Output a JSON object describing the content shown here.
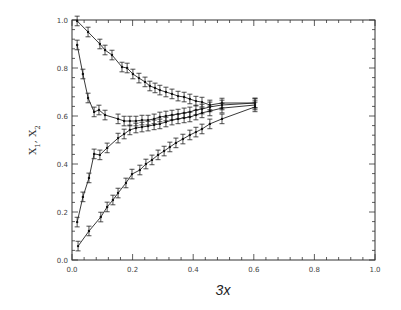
{
  "chart_data": {
    "type": "line",
    "title": "",
    "xlabel": "3x",
    "ylabel": "X1, X2",
    "xlim": [
      0.0,
      1.0
    ],
    "ylim": [
      0.0,
      1.0
    ],
    "grid": false,
    "legend": null,
    "x_ticks": [
      "0.0",
      "0.2",
      "0.4",
      "0.6",
      "0.8",
      "1.0"
    ],
    "y_ticks": [
      "0.0",
      "0.2",
      "0.4",
      "0.6",
      "0.8",
      "1.0"
    ],
    "error_bars": true,
    "series": [
      {
        "name": "upper (from 1.0)",
        "x": [
          0.017,
          0.053,
          0.092,
          0.109,
          0.132,
          0.165,
          0.182,
          0.201,
          0.221,
          0.241,
          0.257,
          0.274,
          0.29,
          0.31,
          0.33,
          0.35,
          0.37,
          0.389,
          0.409,
          0.429,
          0.455,
          0.495,
          0.604
        ],
        "y": [
          0.996,
          0.95,
          0.9,
          0.875,
          0.854,
          0.804,
          0.8,
          0.775,
          0.758,
          0.742,
          0.725,
          0.717,
          0.708,
          0.7,
          0.692,
          0.683,
          0.679,
          0.671,
          0.662,
          0.658,
          0.646,
          0.654,
          0.654
        ],
        "err": 0.02
      },
      {
        "name": "middle-high (from 0.89)",
        "x": [
          0.017,
          0.036,
          0.053,
          0.073,
          0.089,
          0.109,
          0.152,
          0.172,
          0.191,
          0.211,
          0.231,
          0.251,
          0.271,
          0.29,
          0.31,
          0.33,
          0.35,
          0.37,
          0.389,
          0.409,
          0.429,
          0.455,
          0.495,
          0.604
        ],
        "y": [
          0.896,
          0.775,
          0.675,
          0.617,
          0.625,
          0.604,
          0.588,
          0.579,
          0.579,
          0.579,
          0.583,
          0.583,
          0.588,
          0.596,
          0.6,
          0.604,
          0.608,
          0.613,
          0.617,
          0.625,
          0.629,
          0.638,
          0.646,
          0.654
        ],
        "err": 0.02
      },
      {
        "name": "middle-low (from 0.16)",
        "x": [
          0.017,
          0.036,
          0.056,
          0.073,
          0.092,
          0.116,
          0.152,
          0.172,
          0.191,
          0.211,
          0.231,
          0.251,
          0.271,
          0.29,
          0.31,
          0.33,
          0.35,
          0.37,
          0.389,
          0.409,
          0.429,
          0.455,
          0.495,
          0.604
        ],
        "y": [
          0.158,
          0.263,
          0.342,
          0.442,
          0.438,
          0.467,
          0.508,
          0.525,
          0.542,
          0.55,
          0.554,
          0.558,
          0.563,
          0.567,
          0.575,
          0.583,
          0.588,
          0.592,
          0.596,
          0.604,
          0.613,
          0.621,
          0.633,
          0.646
        ],
        "err": 0.02
      },
      {
        "name": "lower (from 0.06)",
        "x": [
          0.02,
          0.056,
          0.095,
          0.116,
          0.135,
          0.152,
          0.178,
          0.198,
          0.224,
          0.244,
          0.264,
          0.284,
          0.304,
          0.323,
          0.343,
          0.366,
          0.389,
          0.409,
          0.429,
          0.455,
          0.495,
          0.604
        ],
        "y": [
          0.058,
          0.121,
          0.179,
          0.221,
          0.25,
          0.279,
          0.321,
          0.358,
          0.375,
          0.4,
          0.417,
          0.438,
          0.454,
          0.471,
          0.488,
          0.504,
          0.521,
          0.533,
          0.546,
          0.567,
          0.588,
          0.638
        ],
        "err": 0.02
      }
    ]
  }
}
